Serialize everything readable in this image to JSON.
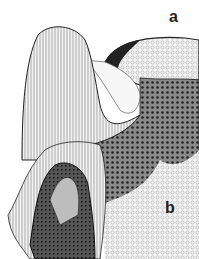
{
  "figure": {
    "labels": {
      "a": "a",
      "b": "b"
    },
    "colors": {
      "ink": "#1a1a1a",
      "paper": "#ffffff",
      "light_stipple": "#d8d8d8",
      "mid_stipple": "#9a9a9a",
      "dark_stipple": "#4a4a4a"
    }
  }
}
